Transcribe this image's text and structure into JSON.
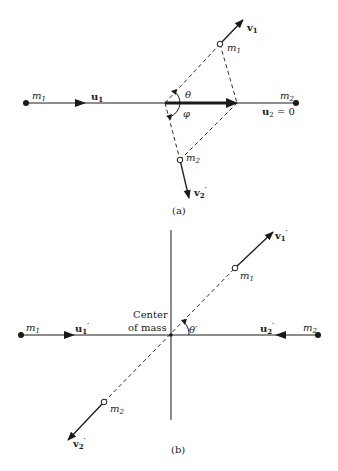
{
  "figure": {
    "panel_a": {
      "caption": "(a)",
      "labels": {
        "m1_initial": "m",
        "m1_initial_sub": "1",
        "u1": "u",
        "u1_sub": "1",
        "m2_initial": "m",
        "m2_initial_sub": "2",
        "u2_eq": "u",
        "u2_sub": "2",
        "u2_val": " = 0",
        "theta": "θ",
        "phi": "φ",
        "m1_final": "m",
        "m1_final_sub": "1",
        "v1": "v",
        "v1_sub": "1",
        "m2_final": "m",
        "m2_final_sub": "2",
        "v2": "v",
        "v2_sub": "2",
        "v2_prime": "′"
      }
    },
    "panel_b": {
      "caption": "(b)",
      "labels": {
        "center_line1": "Center",
        "center_line2": "of mass",
        "m1_initial": "m",
        "m1_initial_sub": "1",
        "u1": "u",
        "u1_sub": "1",
        "u1_prime": "′",
        "m2_initial": "m",
        "m2_initial_sub": "2",
        "u2": "u",
        "u2_sub": "2",
        "u2_prime": "′",
        "theta_prime": "θ′",
        "m1_final": "m",
        "m1_final_sub": "1",
        "v1": "v",
        "v1_sub": "1",
        "v1_prime": "′",
        "m2_final": "m",
        "m2_final_sub": "2",
        "v2": "v",
        "v2_sub": "2",
        "v2_prime": "′"
      }
    },
    "colors": {
      "ink": "#1a1a1a",
      "background": "#ffffff"
    }
  }
}
